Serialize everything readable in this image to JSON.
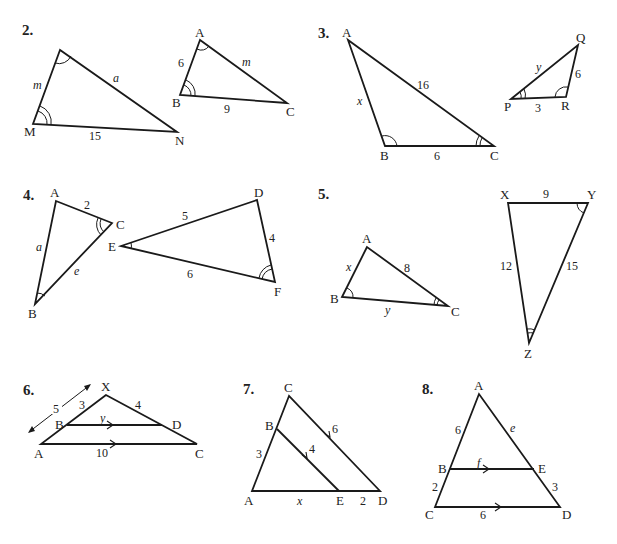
{
  "page": {
    "background": "#ffffff",
    "ink": "#1a1a1a"
  },
  "problems": [
    {
      "number": "2.",
      "figures": [
        {
          "name": "triangle-M-N",
          "vertices": {
            "top": "",
            "M": "M",
            "N": "N"
          },
          "sides": {
            "top_M": "m",
            "top_N": "a",
            "M_N": "15"
          },
          "angle_marks": {
            "top": "single",
            "M": "double"
          }
        },
        {
          "name": "triangle-ABC",
          "vertices": {
            "A": "A",
            "B": "B",
            "C": "C"
          },
          "sides": {
            "AB": "6",
            "AC": "m",
            "BC": "9"
          },
          "angle_marks": {
            "A": "single",
            "B": "double"
          }
        }
      ]
    },
    {
      "number": "3.",
      "figures": [
        {
          "name": "triangle-ABC",
          "vertices": {
            "A": "A",
            "B": "B",
            "C": "C"
          },
          "sides": {
            "AB": "x",
            "AC": "16",
            "BC": "6"
          },
          "angle_marks": {
            "B": "single",
            "C": "double"
          }
        },
        {
          "name": "triangle-PQR",
          "vertices": {
            "P": "P",
            "Q": "Q",
            "R": "R"
          },
          "sides": {
            "PQ": "y",
            "QR": "6",
            "PR": "3"
          },
          "angle_marks": {
            "R": "single",
            "P": "double"
          }
        }
      ]
    },
    {
      "number": "4.",
      "figures": [
        {
          "name": "triangle-ABC",
          "vertices": {
            "A": "A",
            "B": "B",
            "C": "C"
          },
          "sides": {
            "AC": "2",
            "AB": "a",
            "BC": "e"
          },
          "angle_marks": {
            "B": "single",
            "C": "double"
          }
        },
        {
          "name": "triangle-DEF",
          "vertices": {
            "D": "D",
            "E": "E",
            "F": "F"
          },
          "sides": {
            "ED": "5",
            "DF": "4",
            "EF": "6"
          },
          "angle_marks": {
            "E": "single",
            "F": "double"
          }
        }
      ]
    },
    {
      "number": "5.",
      "figures": [
        {
          "name": "triangle-ABC",
          "vertices": {
            "A": "A",
            "B": "B",
            "C": "C"
          },
          "sides": {
            "AB": "x",
            "AC": "8",
            "BC": "y"
          },
          "angle_marks": {
            "B": "single",
            "C": "double"
          }
        },
        {
          "name": "triangle-XYZ",
          "vertices": {
            "X": "X",
            "Y": "Y",
            "Z": "Z"
          },
          "sides": {
            "XY": "9",
            "XZ": "12",
            "YZ": "15"
          },
          "angle_marks": {
            "Y": "single",
            "Z": "double"
          }
        }
      ]
    },
    {
      "number": "6.",
      "figures": [
        {
          "name": "triangle-XAC-with-BD",
          "vertices": {
            "X": "X",
            "A": "A",
            "B": "B",
            "C": "C",
            "D": "D"
          },
          "sides": {
            "XB": "3",
            "XA": "5",
            "XD": "4",
            "BD": "y",
            "AC": "10"
          },
          "parallel": [
            "BD",
            "AC"
          ]
        }
      ]
    },
    {
      "number": "7.",
      "figures": [
        {
          "name": "triangle-ACD-with-BE",
          "vertices": {
            "A": "A",
            "B": "B",
            "C": "C",
            "D": "D",
            "E": "E"
          },
          "sides": {
            "AB": "3",
            "BE": "4",
            "CD": "6",
            "AE": "x",
            "ED": "2"
          },
          "parallel": [
            "BE",
            "CD"
          ]
        }
      ]
    },
    {
      "number": "8.",
      "figures": [
        {
          "name": "triangle-ACD-with-BE",
          "vertices": {
            "A": "A",
            "B": "B",
            "C": "C",
            "D": "D",
            "E": "E"
          },
          "sides": {
            "AB": "6",
            "BC": "2",
            "AE": "e",
            "ED": "3",
            "BE": "f",
            "CD": "6"
          },
          "parallel": [
            "BE",
            "CD"
          ]
        }
      ]
    }
  ]
}
